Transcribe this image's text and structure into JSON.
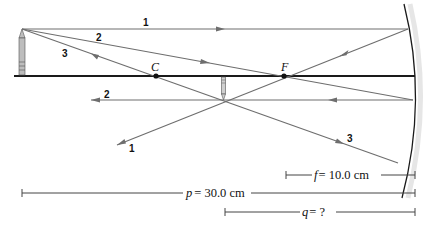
{
  "diagram": {
    "type": "concave-mirror-ray-diagram",
    "colors": {
      "rays": "#6e6e6e",
      "axis": "#1a1a1a",
      "mirror": "#1a1a1a",
      "text": "#111111"
    },
    "points": {
      "center_of_curvature": {
        "label": "C"
      },
      "focal_point": {
        "label": "F"
      }
    },
    "rays": [
      {
        "id": 1,
        "label": "1",
        "description": "parallel to axis, reflects through F"
      },
      {
        "id": 2,
        "label": "2",
        "description": "through F, reflects parallel to axis"
      },
      {
        "id": 3,
        "label": "3",
        "description": "through C, reflects back on itself"
      }
    ],
    "ray_labels_incident": [
      "1",
      "2",
      "3"
    ],
    "ray_labels_reflected": [
      "2",
      "1",
      "3"
    ],
    "dimensions": {
      "focal_length": {
        "var": "f",
        "text": "= 10.0 cm"
      },
      "object_distance": {
        "var": "p",
        "text": "= 30.0 cm"
      },
      "image_distance": {
        "var": "q",
        "text": "= ?"
      }
    }
  }
}
